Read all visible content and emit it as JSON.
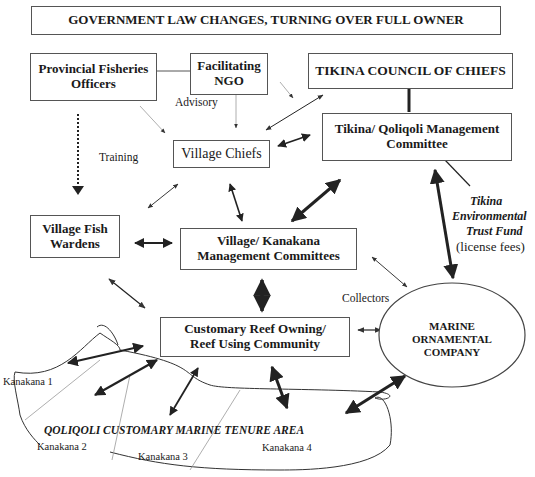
{
  "diagram": {
    "header": "GOVERNMENT LAW CHANGES, TURNING OVER FULL OWNER",
    "nodes": {
      "provincial": "Provincial Fisheries Officers",
      "ngo": "Facilitating NGO",
      "council": "TIKINA COUNCIL OF CHIEFS",
      "village_chiefs": "Village Chiefs",
      "qoliqoli_committee": "Tikina/ Qoliqoli Management Committee",
      "fish_wardens": "Village Fish Wardens",
      "village_committees": "Village/ Kanakana Management Committees",
      "community": "Customary Reef Owning/ Reef Using Community",
      "company": "MARINE ORNAMENTAL COMPANY"
    },
    "labels": {
      "advisory": "Advisory",
      "training": "Training",
      "collectors": "Collectors",
      "trust_fund_1": "Tikina",
      "trust_fund_2": "Environmental",
      "trust_fund_3": "Trust Fund",
      "license_fees": "(license fees)",
      "tenure_area": "QOLIQOLI CUSTOMARY MARINE TENURE AREA",
      "kanakana_1": "Kanakana 1",
      "kanakana_2": "Kanakana 2",
      "kanakana_3": "Kanakana 3",
      "kanakana_4": "Kanakana 4"
    }
  }
}
